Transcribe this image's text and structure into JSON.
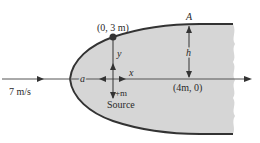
{
  "diagram": {
    "colors": {
      "body_fill": "#d6d6d6",
      "outline": "#333333",
      "text": "#2a2a2a",
      "axis": "#555555"
    },
    "labels": {
      "stagnation_point_top": "(0, 3 m)",
      "point_A": "A",
      "height": "h",
      "y_axis": "y",
      "x_axis": "x",
      "stagnation_a": "a",
      "source_strength": "+m",
      "source": "Source",
      "point_on_axis": "(4m, 0)",
      "freestream_velocity": "7 m/s"
    }
  }
}
